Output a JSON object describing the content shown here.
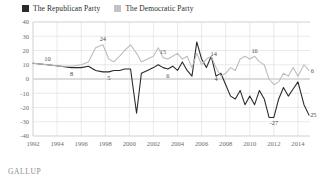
{
  "legend": {
    "items": [
      {
        "label": "The Republican Party",
        "color": "#2b2b2b",
        "icon": "square-swatch-dark"
      },
      {
        "label": "The Democratic Party",
        "color": "#c3c3c3",
        "icon": "square-swatch-light"
      }
    ]
  },
  "footer": {
    "source": "GALLUP"
  },
  "chart_data": {
    "type": "line",
    "title": "",
    "subtitle": "",
    "xlabel": "",
    "ylabel": "",
    "grid": true,
    "legend_position": "top-left",
    "xlim": [
      1992,
      2015
    ],
    "ylim": [
      -40,
      40
    ],
    "yticks": [
      40,
      30,
      20,
      10,
      0,
      -10,
      -20,
      -30,
      -40
    ],
    "ytick_labels": [
      "40",
      "30",
      "20",
      "10",
      "0",
      "-10",
      "-20",
      "-30",
      "-40"
    ],
    "xticks": [
      1992,
      1994,
      1996,
      1998,
      2000,
      2002,
      2004,
      2006,
      2008,
      2010,
      2012,
      2014
    ],
    "xtick_labels": [
      "1992",
      "1994",
      "1996",
      "1998",
      "2000",
      "2002",
      "2004",
      "2006",
      "2008",
      "2010",
      "2012",
      "2014"
    ],
    "series": [
      {
        "name": "The Republican Party",
        "color": "#2b2b2b",
        "x": [
          1992.0,
          1993.2,
          1994.3,
          1995.2,
          1996.0,
          1996.6,
          1997.2,
          1997.8,
          1998.3,
          1998.7,
          1999.2,
          1999.6,
          2000.1,
          2000.6,
          2001.0,
          2001.5,
          2002.0,
          2002.4,
          2002.8,
          2003.2,
          2003.6,
          2004.0,
          2004.4,
          2004.8,
          2005.2,
          2005.6,
          2006.0,
          2006.4,
          2006.8,
          2007.2,
          2007.6,
          2008.0,
          2008.4,
          2008.8,
          2009.2,
          2009.6,
          2010.0,
          2010.4,
          2010.8,
          2011.2,
          2011.6,
          2012.0,
          2012.4,
          2012.8,
          2013.2,
          2013.6,
          2014.0,
          2014.5,
          2014.9
        ],
        "y": [
          11,
          10,
          9,
          8,
          8,
          9,
          6,
          5,
          5,
          6,
          6,
          7,
          7,
          -24,
          4,
          6,
          8,
          10,
          8,
          7,
          9,
          6,
          12,
          6,
          2,
          26,
          14,
          8,
          16,
          2,
          4,
          -4,
          -12,
          -14,
          -8,
          -18,
          -12,
          -18,
          -8,
          -14,
          -27,
          -27,
          -14,
          -6,
          -12,
          -7,
          -2,
          -18,
          -25
        ],
        "labels": [
          {
            "x": 1993.2,
            "y": 10,
            "text": "10",
            "position": "above"
          },
          {
            "x": 1995.2,
            "y": 8,
            "text": "8",
            "position": "below"
          },
          {
            "x": 1998.3,
            "y": 5,
            "text": "5",
            "position": "below"
          },
          {
            "x": 2003.2,
            "y": 6,
            "text": "6",
            "position": "below"
          },
          {
            "x": 2007.2,
            "y": 4,
            "text": "4",
            "position": "below"
          },
          {
            "x": 2012.0,
            "y": -27,
            "text": "-27",
            "position": "below"
          },
          {
            "x": 2014.9,
            "y": -25,
            "text": "-25",
            "position": "right"
          }
        ]
      },
      {
        "name": "The Democratic Party",
        "color": "#bdbdbd",
        "x": [
          1992.0,
          1993.2,
          1994.3,
          1995.2,
          1996.0,
          1996.6,
          1997.2,
          1997.8,
          1998.3,
          1998.7,
          1999.2,
          1999.6,
          2000.1,
          2000.6,
          2001.0,
          2001.5,
          2002.0,
          2002.4,
          2002.8,
          2003.2,
          2003.6,
          2004.0,
          2004.4,
          2004.8,
          2005.2,
          2005.6,
          2006.0,
          2006.4,
          2006.8,
          2007.2,
          2007.6,
          2008.0,
          2008.4,
          2008.8,
          2009.2,
          2009.6,
          2010.0,
          2010.4,
          2010.8,
          2011.2,
          2011.6,
          2012.0,
          2012.4,
          2012.8,
          2013.2,
          2013.6,
          2014.0,
          2014.5,
          2014.9
        ],
        "y": [
          11,
          10,
          9,
          9,
          10,
          12,
          22,
          24,
          14,
          12,
          16,
          20,
          24,
          18,
          12,
          14,
          16,
          22,
          15,
          14,
          16,
          18,
          14,
          16,
          8,
          18,
          10,
          14,
          16,
          8,
          2,
          4,
          8,
          6,
          14,
          16,
          14,
          16,
          12,
          10,
          0,
          -4,
          -2,
          4,
          2,
          8,
          2,
          10,
          6
        ],
        "labels": [
          {
            "x": 1997.8,
            "y": 24,
            "text": "24",
            "position": "above"
          },
          {
            "x": 2002.8,
            "y": 15,
            "text": "15",
            "position": "above"
          },
          {
            "x": 2007.0,
            "y": 14,
            "text": "14",
            "position": "above"
          },
          {
            "x": 2010.4,
            "y": 16,
            "text": "16",
            "position": "above"
          },
          {
            "x": 2014.9,
            "y": 6,
            "text": "6",
            "position": "right"
          }
        ]
      }
    ]
  }
}
